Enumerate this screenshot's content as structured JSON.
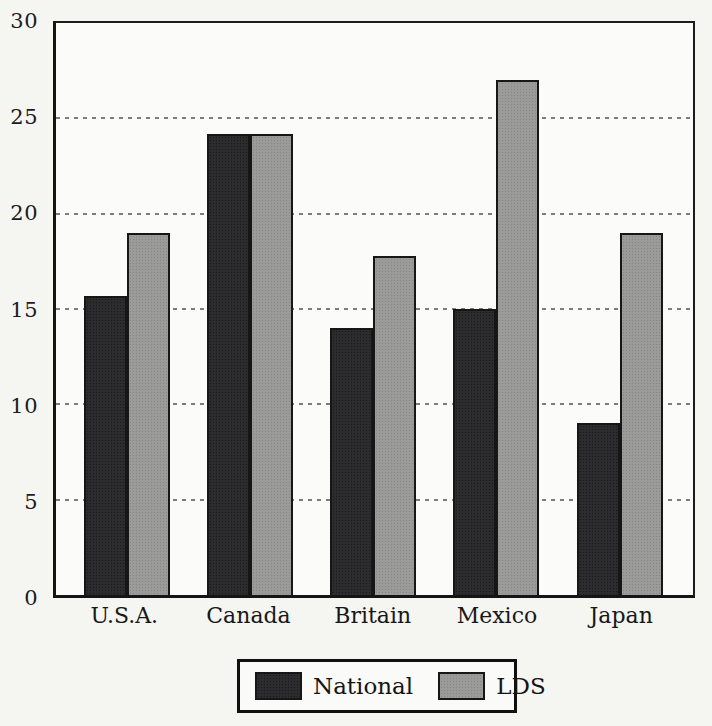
{
  "chart_data": {
    "type": "bar",
    "grouped": true,
    "title": "",
    "xlabel": "",
    "ylabel": "",
    "categories": [
      "U.S.A.",
      "Canada",
      "Britain",
      "Mexico",
      "Japan"
    ],
    "series": [
      {
        "name": "National",
        "color": "#2c2c2f",
        "values": [
          15.7,
          24.2,
          14.0,
          15.0,
          9.0
        ]
      },
      {
        "name": "LDS",
        "color": "#9b9b9a",
        "values": [
          19.0,
          24.2,
          17.8,
          27.0,
          19.0
        ]
      }
    ],
    "ylim": [
      0,
      30
    ],
    "yticks": [
      0,
      5,
      10,
      15,
      20,
      25,
      30
    ],
    "grid": "dashed horizontal lines at 5,10,15,20,25",
    "legend_position": "bottom-center-boxed"
  },
  "layout_hints": {
    "first_group_center_pct": 11.1,
    "last_group_center_pct": 88.5,
    "bar_width_px": 43
  },
  "colors": {
    "frame": "#1c1c1c",
    "paper": "#f5f5f2",
    "plot_background": "#fbfbf9",
    "gridline": "#5d5d5d"
  }
}
